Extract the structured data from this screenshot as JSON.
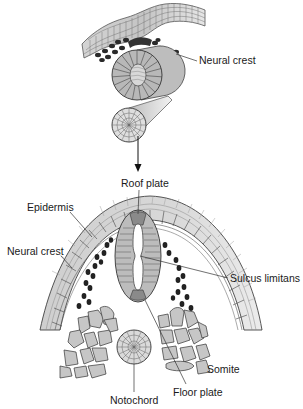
{
  "figure": {
    "top_panel": {
      "labels": {
        "neural_crest": "Neural crest"
      }
    },
    "bottom_panel": {
      "labels": {
        "roof_plate": "Roof plate",
        "epidermis": "Epidermis",
        "neural_crest": "Neural crest",
        "sulcus_limitans": "Sulcus limitans",
        "somite": "Somite",
        "floor_plate": "Floor plate",
        "notochord": "Notochord"
      }
    },
    "colors": {
      "cell_fill": "#c8c8c8",
      "cell_fill_light": "#e2e2e2",
      "neural_crest_cell": "#2a2a2a",
      "outline": "#3a3a3a",
      "floor_roof_plate": "#8a8a8a",
      "background": "#ffffff"
    }
  }
}
